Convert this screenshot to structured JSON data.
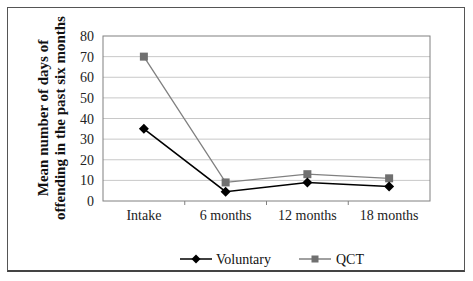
{
  "chart_data": {
    "type": "line",
    "title": "",
    "xlabel": "",
    "ylabel": "Mean number of days of offending in the past six months",
    "ylabel_lines": [
      "Mean number of days of",
      "offending in the past six months"
    ],
    "categories": [
      "Intake",
      "6 months",
      "12 months",
      "18 months"
    ],
    "series": [
      {
        "name": "Voluntary",
        "values": [
          35,
          4.5,
          9,
          7
        ],
        "color": "#000000",
        "marker": "diamond"
      },
      {
        "name": "QCT",
        "values": [
          70,
          9,
          13,
          11
        ],
        "color": "#808080",
        "marker": "square"
      }
    ],
    "ylim": [
      0,
      80
    ],
    "yticks": [
      0,
      10,
      20,
      30,
      40,
      50,
      60,
      70,
      80
    ],
    "grid": true,
    "legend_position": "bottom"
  },
  "legend": {
    "items": [
      {
        "label": "Voluntary"
      },
      {
        "label": "QCT"
      }
    ]
  }
}
